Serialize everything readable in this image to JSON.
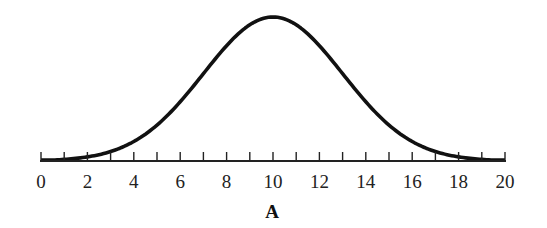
{
  "chart_data": {
    "type": "line",
    "title": "",
    "xlabel": "A",
    "ylabel": "",
    "series": [
      {
        "name": "A",
        "distribution": "normal",
        "mean": 10,
        "sd": 3,
        "x": [
          0,
          1,
          2,
          3,
          4,
          5,
          6,
          7,
          8,
          9,
          10,
          11,
          12,
          13,
          14,
          15,
          16,
          17,
          18,
          19,
          20
        ],
        "values": [
          0.004,
          0.012,
          0.029,
          0.066,
          0.135,
          0.249,
          0.411,
          0.607,
          0.801,
          0.946,
          1.0,
          0.946,
          0.801,
          0.607,
          0.411,
          0.249,
          0.135,
          0.066,
          0.029,
          0.012,
          0.004
        ]
      }
    ],
    "xlim": [
      0,
      20
    ],
    "x_ticks_minor": [
      0,
      1,
      2,
      3,
      4,
      5,
      6,
      7,
      8,
      9,
      10,
      11,
      12,
      13,
      14,
      15,
      16,
      17,
      18,
      19,
      20
    ],
    "x_tick_labels": [
      "0",
      "2",
      "4",
      "6",
      "8",
      "10",
      "12",
      "14",
      "16",
      "18",
      "20"
    ],
    "grid": false,
    "y_axis_visible": false,
    "legend": null
  },
  "colors": {
    "curve": "#111111",
    "axis": "#222222",
    "background": "#ffffff"
  }
}
